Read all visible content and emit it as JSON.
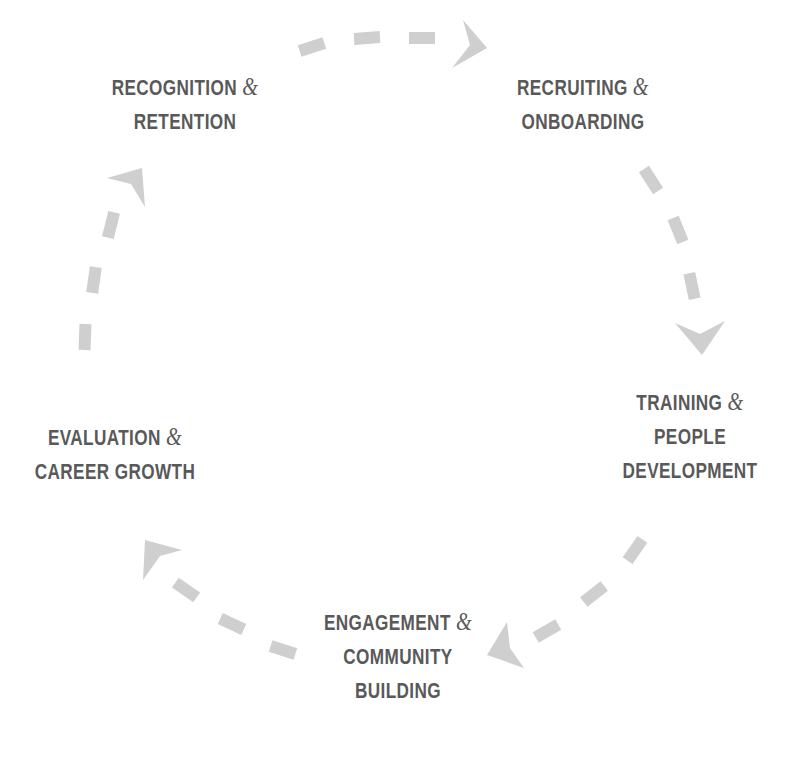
{
  "diagram": {
    "type": "cycle",
    "direction": "clockwise",
    "colors": {
      "text": "#595959",
      "connector": "#cfcfcf",
      "background": "#ffffff"
    },
    "stages": [
      {
        "id": "recruiting",
        "line1": "RECRUITING",
        "amp": "&",
        "line2": "ONBOARDING",
        "line3": ""
      },
      {
        "id": "training",
        "line1": "TRAINING",
        "amp": "&",
        "line2": "PEOPLE",
        "line3": "DEVELOPMENT"
      },
      {
        "id": "engagement",
        "line1": "ENGAGEMENT",
        "amp": "&",
        "line2": "COMMUNITY",
        "line3": "BUILDING"
      },
      {
        "id": "evaluation",
        "line1": "EVALUATION",
        "amp": "&",
        "line2": "CAREER GROWTH",
        "line3": ""
      },
      {
        "id": "recognition",
        "line1": "RECOGNITION",
        "amp": "&",
        "line2": "RETENTION",
        "line3": ""
      }
    ],
    "connectors": [
      {
        "from": "recognition",
        "to": "recruiting",
        "style": "dashed-arrow"
      },
      {
        "from": "recruiting",
        "to": "training",
        "style": "dashed-arrow"
      },
      {
        "from": "training",
        "to": "engagement",
        "style": "dashed-arrow"
      },
      {
        "from": "engagement",
        "to": "evaluation",
        "style": "dashed-arrow"
      },
      {
        "from": "evaluation",
        "to": "recognition",
        "style": "dashed-arrow"
      }
    ]
  }
}
